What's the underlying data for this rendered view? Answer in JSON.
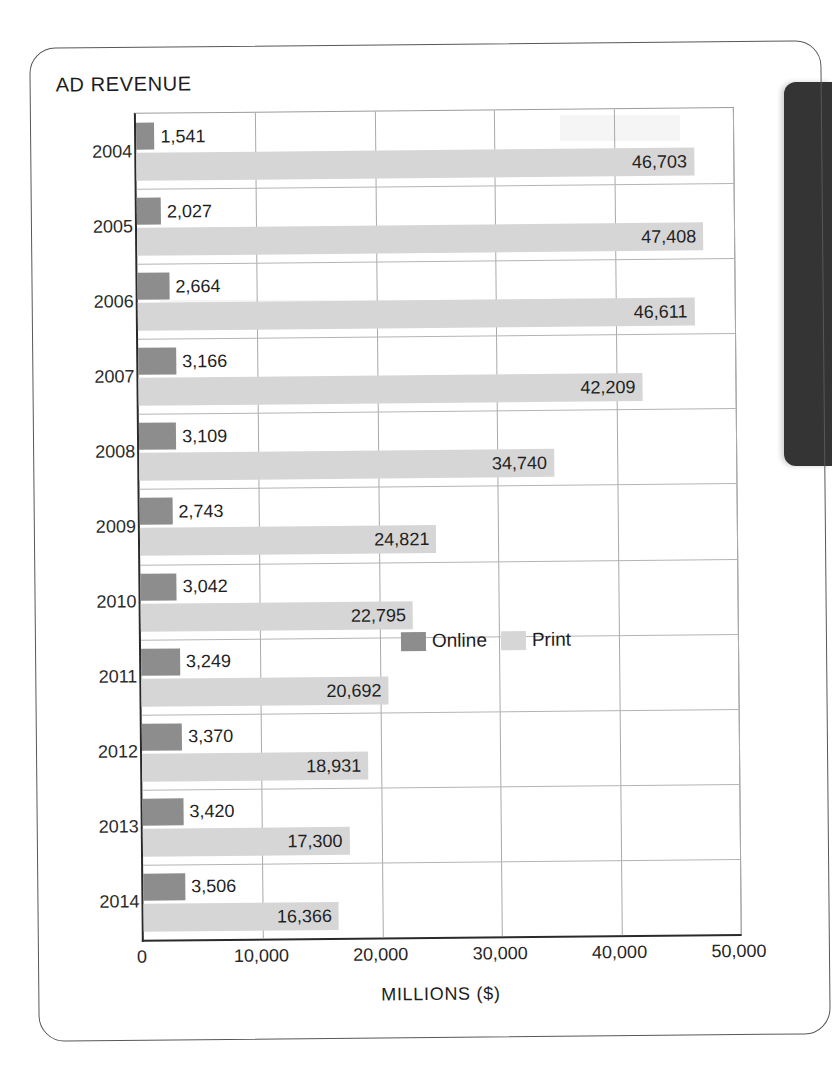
{
  "figure": {
    "title": "AD REVENUE"
  },
  "chart_data": {
    "type": "bar",
    "orientation": "horizontal",
    "title": "AD REVENUE",
    "xlabel": "MILLIONS ($)",
    "ylabel": "",
    "xlim": [
      0,
      50000
    ],
    "xticks": [
      0,
      10000,
      20000,
      30000,
      40000,
      50000
    ],
    "xtick_labels": [
      "0",
      "10,000",
      "20,000",
      "30,000",
      "40,000",
      "50,000"
    ],
    "grid": true,
    "grid_axis": "x",
    "legend_position": "inside-middle-right",
    "categories": [
      "2004",
      "2005",
      "2006",
      "2007",
      "2008",
      "2009",
      "2010",
      "2011",
      "2012",
      "2013",
      "2014"
    ],
    "series": [
      {
        "name": "Online",
        "color": "#8d8d8d",
        "values": [
          1541,
          2027,
          2664,
          3166,
          3109,
          2743,
          3042,
          3249,
          3370,
          3420,
          3506
        ],
        "labels": [
          "1,541",
          "2,027",
          "2,664",
          "3,166",
          "3,109",
          "2,743",
          "3,042",
          "3,249",
          "3,370",
          "3,420",
          "3,506"
        ]
      },
      {
        "name": "Print",
        "color": "#d6d6d6",
        "values": [
          46703,
          47408,
          46611,
          42209,
          34740,
          24821,
          22795,
          20692,
          18931,
          17300,
          16366
        ],
        "labels": [
          "46,703",
          "47,408",
          "46,611",
          "42,209",
          "34,740",
          "24,821",
          "22,795",
          "20,692",
          "18,931",
          "17,300",
          "16,366"
        ]
      }
    ]
  },
  "legend": {
    "items": [
      {
        "label": "Online",
        "color": "#8d8d8d"
      },
      {
        "label": "Print",
        "color": "#d6d6d6"
      }
    ]
  },
  "axis": {
    "x_title": "MILLIONS ($)"
  },
  "colors": {
    "online": "#8d8d8d",
    "print": "#d6d6d6",
    "axis": "#2a2a2a",
    "grid": "#a9a9a9",
    "card_border": "#585858",
    "page_edge": "#343434"
  }
}
